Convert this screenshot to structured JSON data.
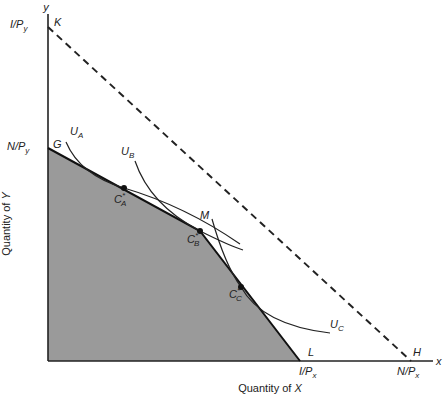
{
  "diagram": {
    "type": "consumer-choice-budget-constraint",
    "axes": {
      "x_label": "Quantity of X",
      "y_label": "Quantity of Y",
      "x_axis_name": "x",
      "y_axis_name": "y"
    },
    "intercepts": {
      "y_income": {
        "text": "I/P",
        "sub": "y",
        "point": "K"
      },
      "y_endowment": {
        "text": "N/P",
        "sub": "y",
        "point": "G"
      },
      "x_income": {
        "text": "I/P",
        "sub": "x",
        "point": "L"
      },
      "x_endowment": {
        "text": "N/P",
        "sub": "x",
        "point": "H"
      }
    },
    "points": {
      "K": "K",
      "G": "G",
      "M": "M",
      "L": "L",
      "H": "H"
    },
    "optima": [
      {
        "base": "C",
        "sup": "*",
        "sub": "A"
      },
      {
        "base": "C",
        "sup": "*",
        "sub": "B"
      },
      {
        "base": "C",
        "sup": "*",
        "sub": "C"
      }
    ],
    "indifference_curves": [
      {
        "base": "U",
        "sub": "A"
      },
      {
        "base": "U",
        "sub": "B"
      },
      {
        "base": "U",
        "sub": "C"
      }
    ],
    "lines": [
      {
        "name": "income-budget-line",
        "from": "K",
        "to": "H",
        "style": "dashed"
      },
      {
        "name": "kinked-budget-constraint",
        "path": [
          "G",
          "M",
          "L"
        ],
        "style": "solid"
      }
    ],
    "feasible_region_color": "#9a9a9a"
  }
}
